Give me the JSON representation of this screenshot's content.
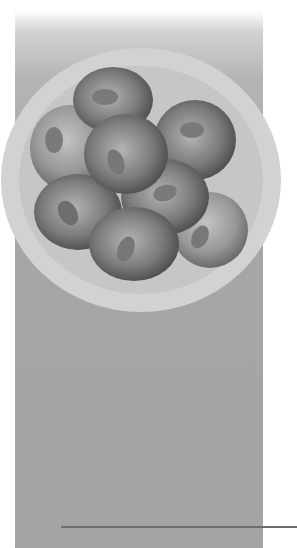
{
  "illustration": {
    "subject": "embryo-8-cell-stage",
    "cell_count": 8,
    "colors": {
      "background": "#ffffff",
      "panel": "#a6a6a6",
      "zona": "#d0d0d0",
      "zona_inner": "#c4c4c4",
      "cell_light": "#b8b8b8",
      "cell_dark": "#4a4a4a",
      "nucleus": "#7a7a7a",
      "rule": "#6e6e6e"
    }
  }
}
